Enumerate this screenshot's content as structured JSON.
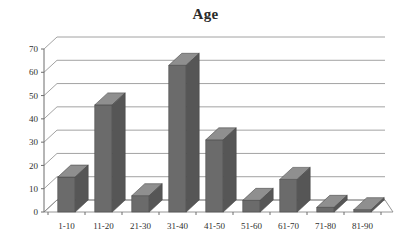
{
  "chart_data": {
    "type": "bar",
    "title": "Age",
    "xlabel": "",
    "ylabel": "",
    "categories": [
      "1-10",
      "11-20",
      "21-30",
      "31-40",
      "41-50",
      "51-60",
      "61-70",
      "71-80",
      "81-90"
    ],
    "values": [
      15,
      46,
      7,
      63,
      31,
      5,
      14,
      2,
      1
    ],
    "ylim": [
      0,
      70
    ],
    "yticks": [
      0,
      10,
      20,
      30,
      40,
      50,
      60,
      70
    ],
    "ytick_labels": [
      "0",
      "10",
      "20",
      "30",
      "40",
      "50",
      "60",
      "70"
    ],
    "grid": true,
    "legend": false,
    "style": "3d-column",
    "colors": {
      "bar_front": "#6b6b6b",
      "bar_top": "#8f8f8f",
      "bar_side": "#565656",
      "gridline": "#8a8a8a",
      "axis": "#6d6d6d",
      "text": "#2f2f2f",
      "background": "#ffffff"
    }
  }
}
